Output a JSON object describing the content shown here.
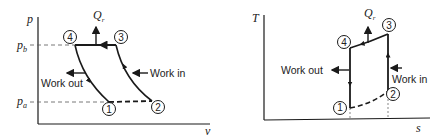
{
  "diagrams": [
    {
      "id": "pv",
      "y_axis_label": "p",
      "x_axis_label": "v",
      "pressure_labels": {
        "high": "p_b",
        "low": "p_a",
        "high_main": "p",
        "high_sub": "b",
        "low_main": "p",
        "low_sub": "a"
      },
      "heat_label": {
        "main": "Q",
        "sub": "r"
      },
      "work_out_label": "Work out",
      "work_in_label": "Work in",
      "states": [
        "1",
        "2",
        "3",
        "4"
      ]
    },
    {
      "id": "Ts",
      "y_axis_label": "T",
      "x_axis_label": "s",
      "heat_label": {
        "main": "Q",
        "sub": "r"
      },
      "work_out_label": "Work out",
      "work_in_label": "Work in",
      "states": [
        "1",
        "2",
        "3",
        "4"
      ]
    }
  ],
  "colors": {
    "line": "#1a1a1a",
    "dashed": "#555555",
    "background": "#ffffff"
  }
}
